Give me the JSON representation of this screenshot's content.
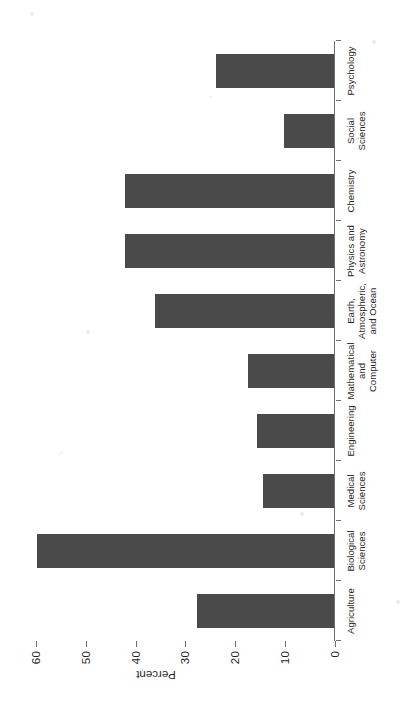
{
  "chart_data": {
    "type": "bar",
    "orientation": "horizontal",
    "title": "",
    "subtitle": "",
    "xlabel": "Percent",
    "ylabel": "",
    "categories": [
      "Agriculture",
      "Biological Sciences",
      "Medical Sciences",
      "Engineering",
      "Mathematical and Computer",
      "Earth, Atmospheric, and Ocean",
      "Physics and Astronomy",
      "Chemistry",
      "Social Sciences",
      "Psychology"
    ],
    "category_lines": [
      [
        "Agriculture"
      ],
      [
        "Biological",
        "Sciences"
      ],
      [
        "Medical",
        "Sciences"
      ],
      [
        "Engineering"
      ],
      [
        "Mathematical",
        "and",
        "Computer"
      ],
      [
        "Earth,",
        "Atmospheric,",
        "and Ocean"
      ],
      [
        "Physics and",
        "Astronomy"
      ],
      [
        "Chemistry"
      ],
      [
        "Social",
        "Sciences"
      ],
      [
        "Psychology"
      ]
    ],
    "values": [
      27.5,
      59.5,
      14.2,
      15.4,
      17.2,
      36.0,
      42.0,
      42.0,
      10.0,
      23.6
    ],
    "value_axis_label": "Percent",
    "ylim": [
      0,
      70
    ],
    "ticks": [
      0,
      10,
      20,
      30,
      40,
      50,
      60,
      70
    ],
    "tick_labels": [
      "0",
      "10",
      "20",
      "30",
      "40",
      "50",
      "60",
      "70"
    ],
    "grid": false,
    "legend": false,
    "bar_color": "#4a4a4a",
    "axis_color": "#6e6e6e",
    "background": "#ffffff",
    "page_rotation_degrees": -90
  }
}
